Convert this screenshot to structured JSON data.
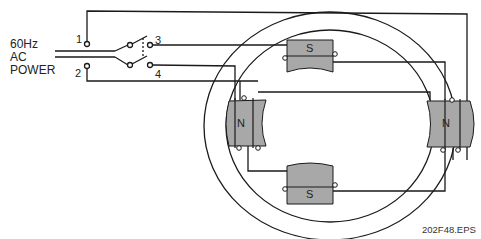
{
  "power_label": {
    "line1": "60Hz",
    "line2": "AC",
    "line3": "POWER"
  },
  "terminals": {
    "t1": "1",
    "t2": "2",
    "t3": "3",
    "t4": "4"
  },
  "poles": {
    "top": "S",
    "bottom": "S",
    "left": "N",
    "right": "N"
  },
  "file_name": "202F48.EPS",
  "colors": {
    "pole_fill": "#a8a8a8",
    "wire": "#1a1a1a"
  }
}
